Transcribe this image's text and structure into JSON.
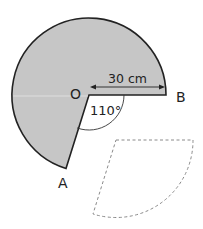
{
  "diagram": {
    "type": "circle-sector-cutout",
    "center_label": "O",
    "points": [
      "O",
      "A",
      "B"
    ],
    "point_labels": {
      "O": "O",
      "A": "A",
      "B": "B"
    },
    "radius_label": "30 cm",
    "angle_label": "110°",
    "colors": {
      "fill": "#c6c6c6",
      "stroke": "#222222",
      "dashed": "#8a8a8a"
    }
  }
}
